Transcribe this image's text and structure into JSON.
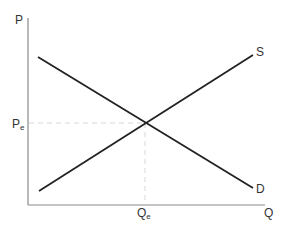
{
  "diagram": {
    "type": "supply-demand",
    "axes": {
      "y_label": "P",
      "x_label": "Q"
    },
    "curves": {
      "supply": {
        "label": "S",
        "from": [
          39,
          191
        ],
        "to": [
          253,
          55
        ]
      },
      "demand": {
        "label": "D",
        "from": [
          38,
          57
        ],
        "to": [
          253,
          188
        ]
      }
    },
    "equilibrium": {
      "price_label": "P",
      "price_subscript": "e",
      "quantity_label": "Q",
      "quantity_subscript": "e",
      "point": [
        145,
        123
      ]
    },
    "colors": {
      "axis": "#8a8a8a",
      "curve": "#222222",
      "guide": "#d8d8d8",
      "text": "#333333"
    }
  }
}
